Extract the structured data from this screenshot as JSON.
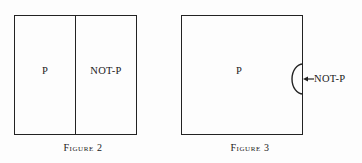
{
  "page": {
    "background_color": "#fdfdfd",
    "ink_color": "#232323",
    "width": 362,
    "height": 163
  },
  "figures": [
    {
      "id": "figure-2",
      "caption": "Figure 2",
      "frame": {
        "x": 14,
        "y": 15,
        "width": 123,
        "height": 120
      },
      "divider_x": 75,
      "regions": [
        {
          "name": "p-region",
          "label": "P",
          "center_x": 45,
          "center_y": 71
        },
        {
          "name": "not-p-region",
          "label": "NOT-P",
          "center_x": 106,
          "center_y": 71
        }
      ],
      "caption_center_x": 83,
      "caption_y": 143
    },
    {
      "id": "figure-3",
      "caption": "Figure 3",
      "frame": {
        "x": 181,
        "y": 15,
        "width": 122,
        "height": 120
      },
      "regions": [
        {
          "name": "p-region",
          "label": "P",
          "center_x": 239,
          "center_y": 71
        }
      ],
      "bulge": {
        "name": "not-p-semicircle",
        "edge_x": 303,
        "top_y": 64,
        "bottom_y": 94,
        "depth": 12
      },
      "pointer": {
        "name": "not-p-pointer",
        "label": "NOT-P",
        "tip_x": 305,
        "tail_x": 313,
        "y": 79,
        "label_x": 314,
        "label_y": 74
      },
      "caption_center_x": 250,
      "caption_y": 143
    }
  ]
}
